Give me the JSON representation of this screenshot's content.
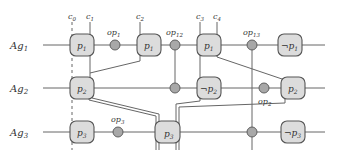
{
  "diagram": {
    "agents": [
      {
        "id": "ag1",
        "label": "Ag",
        "sub": "1"
      },
      {
        "id": "ag2",
        "label": "Ag",
        "sub": "2"
      },
      {
        "id": "ag3",
        "label": "Ag",
        "sub": "3"
      }
    ],
    "cuts": [
      {
        "id": "c0",
        "label": "c",
        "sub": "0",
        "style": "dashed"
      },
      {
        "id": "c1",
        "label": "c",
        "sub": "1",
        "style": "solid"
      },
      {
        "id": "c2",
        "label": "c",
        "sub": "2",
        "style": "solid"
      },
      {
        "id": "c3",
        "label": "c",
        "sub": "3",
        "style": "solid"
      },
      {
        "id": "c4",
        "label": "c",
        "sub": "4",
        "style": "solid"
      }
    ],
    "row1": {
      "states": [
        {
          "neg": "",
          "label": "p",
          "sub": "1"
        },
        {
          "neg": "",
          "label": "p",
          "sub": "1"
        },
        {
          "neg": "",
          "label": "p",
          "sub": "1"
        },
        {
          "neg": "¬",
          "label": "p",
          "sub": "1"
        }
      ],
      "ops": [
        {
          "label": "op",
          "sub": "1"
        },
        {
          "label": "op",
          "sub": "12"
        },
        {
          "label": "op",
          "sub": "13"
        }
      ]
    },
    "row2": {
      "states": [
        {
          "neg": "",
          "label": "p",
          "sub": "2"
        },
        {
          "neg": "¬",
          "label": "p",
          "sub": "2"
        },
        {
          "neg": "",
          "label": "p",
          "sub": "2"
        }
      ],
      "ops": [
        {
          "label": "",
          "sub": ""
        },
        {
          "label": "op",
          "sub": "2"
        }
      ]
    },
    "row3": {
      "states": [
        {
          "neg": "",
          "label": "p",
          "sub": "3"
        },
        {
          "neg": "",
          "label": "p",
          "sub": "3"
        },
        {
          "neg": "¬",
          "label": "p",
          "sub": "3"
        }
      ],
      "ops": [
        {
          "label": "op",
          "sub": "3"
        },
        {
          "label": "",
          "sub": ""
        }
      ]
    }
  }
}
